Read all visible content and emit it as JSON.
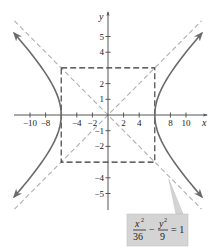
{
  "chart_data": {
    "type": "line",
    "title": "",
    "xlabel": "x",
    "ylabel": "y",
    "xlim": [
      -12,
      12
    ],
    "ylim": [
      -6,
      6
    ],
    "grid": false,
    "x_ticks": [
      -10,
      -8,
      -4,
      -2,
      2,
      4,
      8,
      10
    ],
    "x_tick_labels": [
      "−10",
      "−8",
      "−4",
      "−2",
      "2",
      "4",
      "8",
      "10"
    ],
    "y_ticks": [
      5,
      4,
      2,
      1,
      -1,
      -2,
      -4,
      -5
    ],
    "y_tick_labels": [
      "5",
      "4",
      "2",
      "1",
      "−1",
      "−2",
      "−4",
      "−5"
    ],
    "series": [
      {
        "name": "hyperbola",
        "equation": "x^2/36 - y^2/9 = 1",
        "a": 6,
        "b": 3,
        "color": "#6b6b6b",
        "style": "solid",
        "arrows": true
      },
      {
        "name": "asymptotes",
        "equations": [
          "y = x/2",
          "y = -x/2"
        ],
        "color": "#b0b0b0",
        "style": "dashed"
      },
      {
        "name": "fundamental-rectangle",
        "corners": [
          [
            -6,
            3
          ],
          [
            6,
            3
          ],
          [
            6,
            -3
          ],
          [
            -6,
            -3
          ]
        ],
        "color": "#333333",
        "style": "dashed"
      }
    ],
    "annotation": {
      "numerator1": "x",
      "exp1": "2",
      "denominator1": "36",
      "minus": "−",
      "numerator2": "y",
      "exp2": "2",
      "denominator2": "9",
      "equals": "= 1",
      "box_color": "#d4d4d4",
      "points_to": [
        7.8,
        -4.1
      ]
    }
  }
}
